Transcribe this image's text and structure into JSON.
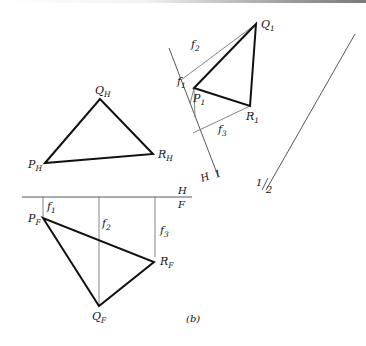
{
  "figure": {
    "caption": "(b)",
    "top_view": {
      "name": "H",
      "points": {
        "P": {
          "label": "P",
          "sub": "H",
          "x": 45,
          "y": 163
        },
        "Q": {
          "label": "Q",
          "sub": "H",
          "x": 100,
          "y": 99
        },
        "R": {
          "label": "R",
          "sub": "H",
          "x": 153,
          "y": 154
        }
      }
    },
    "front_view": {
      "name": "F",
      "points": {
        "P": {
          "label": "P",
          "sub": "F",
          "x": 43,
          "y": 218
        },
        "Q": {
          "label": "Q",
          "sub": "F",
          "x": 99,
          "y": 306
        },
        "R": {
          "label": "R",
          "sub": "F",
          "x": 154,
          "y": 262
        }
      },
      "distances": [
        {
          "label": "f",
          "sub": "1"
        },
        {
          "label": "f",
          "sub": "2"
        },
        {
          "label": "f",
          "sub": "3"
        }
      ]
    },
    "auxiliary_view": {
      "name": "1",
      "points": {
        "P": {
          "label": "P",
          "sub": "1",
          "x": 194,
          "y": 88
        },
        "Q": {
          "label": "Q",
          "sub": "1",
          "x": 256,
          "y": 24
        },
        "R": {
          "label": "R",
          "sub": "1",
          "x": 250,
          "y": 106
        }
      },
      "distances": [
        {
          "label": "f",
          "sub": "1"
        },
        {
          "label": "f",
          "sub": "2"
        },
        {
          "label": "f",
          "sub": "3"
        }
      ]
    },
    "fold_lines": [
      {
        "id": "H/F",
        "top_label": "H",
        "bottom_label": "F"
      },
      {
        "id": "H/1",
        "left_label": "H",
        "right_label": "1"
      },
      {
        "id": "1/2",
        "left_label": "1",
        "right_label": "2"
      }
    ]
  }
}
